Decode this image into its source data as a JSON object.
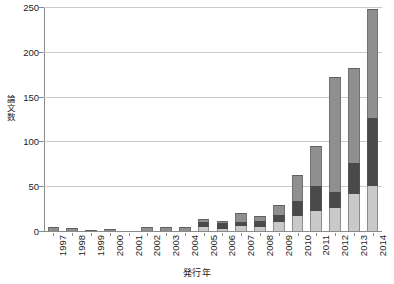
{
  "chart_data": {
    "type": "bar",
    "stacked": true,
    "title": "",
    "subtitle": "",
    "xlabel": "発行年",
    "ylabel": "論文数",
    "categories": [
      "1997",
      "1998",
      "1999",
      "2000",
      "2001",
      "2002",
      "2003",
      "2004",
      "2005",
      "2006",
      "2007",
      "2008",
      "2009",
      "2010",
      "2011",
      "2012",
      "2013",
      "2014"
    ],
    "ylim": [
      0,
      250
    ],
    "yticks": [
      0,
      50,
      100,
      150,
      200,
      250
    ],
    "ytick_labels": [
      "0",
      "50",
      "100",
      "150",
      "200",
      "250"
    ],
    "xlim_note": "categorical, 18 bars",
    "grid": "horizontal only",
    "legend": "none",
    "series": [
      {
        "name": "series-1-light-gray",
        "color": "#c9c9c9",
        "values": [
          0,
          0,
          0,
          0,
          0,
          0,
          0,
          0,
          4,
          2,
          6,
          5,
          10,
          17,
          22,
          26,
          41,
          50
        ]
      },
      {
        "name": "series-2-dark-gray",
        "color": "#4a4a4a",
        "values": [
          0,
          0,
          0,
          0,
          0,
          0,
          0,
          0,
          6,
          7,
          4,
          6,
          8,
          17,
          28,
          18,
          35,
          76
        ]
      },
      {
        "name": "series-3-medium-gray",
        "color": "#8f8f8f",
        "values": [
          5,
          3,
          1,
          2,
          0,
          4,
          4,
          5,
          3,
          2,
          10,
          6,
          11,
          29,
          45,
          128,
          106,
          122
        ]
      }
    ],
    "totals": [
      5,
      3,
      1,
      2,
      0,
      4,
      4,
      5,
      13,
      11,
      20,
      17,
      29,
      63,
      95,
      172,
      182,
      248
    ],
    "colors": {
      "bottom": "#c9c9c9",
      "middle": "#4a4a4a",
      "top": "#8f8f8f",
      "gridline": "#c9c9c9",
      "axis": "#8a8a8a",
      "text": "#1d1d1d",
      "background": "#ffffff"
    }
  }
}
